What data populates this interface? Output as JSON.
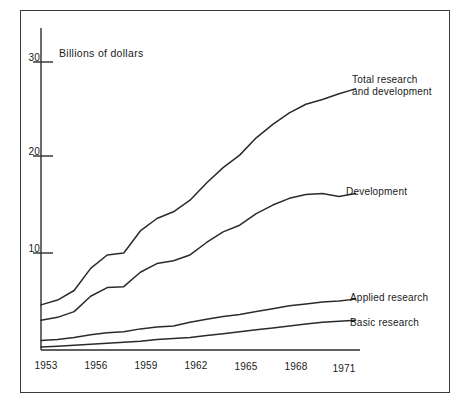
{
  "figure": {
    "axis_title": "Billions of dollars",
    "y_ticks": [
      "30",
      "20",
      "10"
    ],
    "x_ticks": [
      "1953",
      "1956",
      "1959",
      "1962",
      "1965",
      "1968",
      "1971"
    ],
    "labels": {
      "total": "Total research\nand development",
      "development": "Development",
      "applied": "Applied research",
      "basic": "Basic research"
    }
  },
  "chart_data": {
    "type": "line",
    "title": "",
    "subtitle": "",
    "xlabel": "",
    "ylabel": "Billions of dollars",
    "xlim": [
      1953,
      1972
    ],
    "ylim": [
      0,
      31
    ],
    "grid": false,
    "legend_position": "right-inline-labels",
    "x_tick_labels": [
      "1953",
      "1956",
      "1959",
      "1962",
      "1965",
      "1968",
      "1971"
    ],
    "y_tick_labels": [
      "10",
      "20",
      "30"
    ],
    "x": [
      1953,
      1954,
      1955,
      1956,
      1957,
      1958,
      1959,
      1960,
      1961,
      1962,
      1963,
      1964,
      1965,
      1966,
      1967,
      1968,
      1969,
      1970,
      1971,
      1972
    ],
    "series": [
      {
        "name": "Total research and development",
        "label": "Total research\nand development",
        "values": [
          4.7,
          5.2,
          6.2,
          8.5,
          9.9,
          10.1,
          12.4,
          13.7,
          14.4,
          15.6,
          17.4,
          19.0,
          20.3,
          22.1,
          23.5,
          24.7,
          25.6,
          26.1,
          26.7,
          27.2
        ]
      },
      {
        "name": "Development",
        "label": "Development",
        "values": [
          3.1,
          3.4,
          4.0,
          5.6,
          6.5,
          6.6,
          8.1,
          9.0,
          9.3,
          9.9,
          11.2,
          12.3,
          13.0,
          14.2,
          15.1,
          15.8,
          16.2,
          16.3,
          16.0,
          16.3
        ]
      },
      {
        "name": "Applied research",
        "label": "Applied research",
        "values": [
          1.0,
          1.1,
          1.3,
          1.6,
          1.8,
          1.9,
          2.2,
          2.4,
          2.5,
          2.9,
          3.2,
          3.5,
          3.7,
          4.0,
          4.3,
          4.6,
          4.8,
          5.0,
          5.1,
          5.3
        ]
      },
      {
        "name": "Basic research",
        "label": "Basic research",
        "values": [
          0.3,
          0.4,
          0.5,
          0.6,
          0.7,
          0.8,
          0.9,
          1.1,
          1.2,
          1.3,
          1.5,
          1.7,
          1.9,
          2.1,
          2.3,
          2.5,
          2.7,
          2.9,
          3.0,
          3.1
        ]
      }
    ]
  }
}
